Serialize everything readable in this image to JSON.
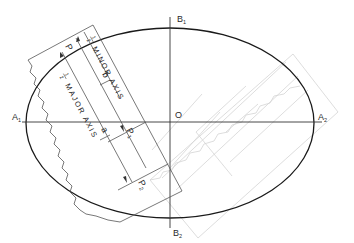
{
  "figure": {
    "type": "trammel-ellipse-construction",
    "colors": {
      "ellipse": "#1a1a1a",
      "axis": "#333333",
      "strip": "#555555",
      "ghost_strip": "#d0d0d0",
      "text": "#2a2a2a"
    }
  },
  "ellipse": {
    "center": {
      "x": 170,
      "y": 123
    },
    "rx": 144,
    "ry": 95
  },
  "axes": {
    "major": {
      "start_label": "A",
      "start_sub": "1",
      "end_label": "A",
      "end_sub": "2"
    },
    "minor": {
      "start_label": "B",
      "start_sub": "1",
      "end_label": "B",
      "end_sub": "2"
    },
    "center_label": "O"
  },
  "trammel": {
    "point_p": "P",
    "point_p1": "P",
    "point_p1_sub": "1",
    "point_p2": "P",
    "point_p2_sub": "2",
    "minor_text": "MINOR  AXIS",
    "minor_frac_num": "1",
    "minor_frac_den": "2",
    "minor_dim_label": "b",
    "major_text": "MAJOR  AXIS",
    "major_frac_num": "1",
    "major_frac_den": "2",
    "major_dim_label": "a"
  }
}
